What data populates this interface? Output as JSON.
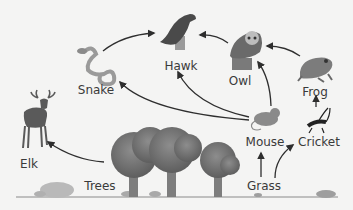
{
  "diagram": {
    "type": "food-web",
    "colors": {
      "background": "#f4f4f3",
      "arrow": "#2e2e2e",
      "label": "#3a3a3a",
      "foliage": "#6f6f6f",
      "trunk": "#7d7d7d",
      "ground": "#8a8a8a"
    },
    "organisms": [
      {
        "id": "snake",
        "label": "Snake",
        "icon": "snake-icon"
      },
      {
        "id": "hawk",
        "label": "Hawk",
        "icon": "hawk-icon"
      },
      {
        "id": "owl",
        "label": "Owl",
        "icon": "owl-icon"
      },
      {
        "id": "frog",
        "label": "Frog",
        "icon": "frog-icon"
      },
      {
        "id": "elk",
        "label": "Elk",
        "icon": "elk-icon"
      },
      {
        "id": "mouse",
        "label": "Mouse",
        "icon": "mouse-icon"
      },
      {
        "id": "cricket",
        "label": "Cricket",
        "icon": "cricket-icon"
      },
      {
        "id": "trees",
        "label": "Trees",
        "icon": "trees-icon"
      },
      {
        "id": "grass",
        "label": "Grass",
        "icon": "grass-icon"
      }
    ],
    "edges": [
      {
        "from": "snake",
        "to": "hawk"
      },
      {
        "from": "owl",
        "to": "hawk"
      },
      {
        "from": "frog",
        "to": "owl"
      },
      {
        "from": "mouse",
        "to": "snake"
      },
      {
        "from": "mouse",
        "to": "hawk"
      },
      {
        "from": "mouse",
        "to": "owl"
      },
      {
        "from": "cricket",
        "to": "frog"
      },
      {
        "from": "trees",
        "to": "elk"
      },
      {
        "from": "grass",
        "to": "mouse"
      },
      {
        "from": "grass",
        "to": "cricket"
      }
    ]
  }
}
